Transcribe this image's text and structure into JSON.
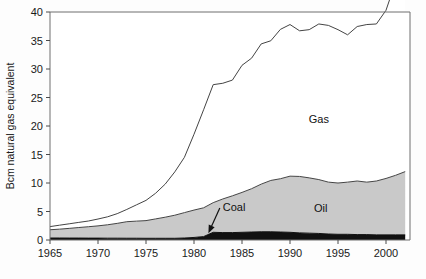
{
  "chart_data": {
    "type": "area",
    "stacked": true,
    "title": "",
    "subtitle": "",
    "xlabel": "",
    "ylabel": "Bcm natural gas equivalent",
    "xlim": [
      1965,
      2002.5
    ],
    "ylim": [
      0,
      40
    ],
    "grid": false,
    "legend_position": "inline-annotations",
    "xticks": [
      1965,
      1970,
      1975,
      1980,
      1985,
      1990,
      1995,
      2000
    ],
    "xticklabels": [
      "1965",
      "1970",
      "1975",
      "1980",
      "1985",
      "1990",
      "1995",
      "2000"
    ],
    "yticks": [
      0,
      5,
      10,
      15,
      20,
      25,
      30,
      35,
      40
    ],
    "yticklabels": [
      "0",
      "5",
      "10",
      "15",
      "20",
      "25",
      "30",
      "35",
      "40"
    ],
    "x": [
      1965,
      1966,
      1967,
      1968,
      1969,
      1970,
      1971,
      1972,
      1973,
      1974,
      1975,
      1976,
      1977,
      1978,
      1979,
      1980,
      1981,
      1982,
      1983,
      1984,
      1985,
      1986,
      1987,
      1988,
      1989,
      1990,
      1991,
      1992,
      1993,
      1994,
      1995,
      1996,
      1997,
      1998,
      1999,
      2000,
      2001,
      2002
    ],
    "series": [
      {
        "name": "Coal",
        "color": "#111111",
        "values": [
          0.35,
          0.35,
          0.34,
          0.34,
          0.33,
          0.33,
          0.32,
          0.32,
          0.31,
          0.31,
          0.3,
          0.3,
          0.3,
          0.3,
          0.35,
          0.45,
          0.6,
          1.35,
          1.3,
          1.3,
          1.35,
          1.4,
          1.45,
          1.45,
          1.4,
          1.35,
          1.25,
          1.2,
          1.15,
          1.05,
          1.0,
          1.0,
          0.95,
          0.95,
          0.9,
          0.9,
          0.9,
          0.9
        ]
      },
      {
        "name": "Oil",
        "color": "#c9c9c9",
        "values": [
          1.45,
          1.55,
          1.7,
          1.85,
          2.0,
          2.15,
          2.35,
          2.6,
          2.9,
          3.0,
          3.1,
          3.4,
          3.7,
          4.05,
          4.45,
          4.8,
          5.05,
          5.2,
          5.9,
          6.45,
          7.0,
          7.6,
          8.35,
          9.0,
          9.35,
          9.85,
          9.9,
          9.7,
          9.45,
          9.1,
          9.0,
          9.15,
          9.4,
          9.2,
          9.45,
          9.9,
          10.45,
          11.1
        ]
      },
      {
        "name": "Gas",
        "color": "#ffffff",
        "values": [
          0.55,
          0.7,
          0.8,
          0.9,
          1.0,
          1.2,
          1.4,
          1.7,
          2.15,
          2.85,
          3.55,
          4.5,
          5.8,
          7.6,
          9.7,
          13.3,
          17.2,
          20.7,
          20.3,
          20.3,
          22.3,
          22.9,
          24.6,
          24.5,
          26.2,
          26.6,
          25.55,
          26.0,
          27.3,
          27.5,
          26.9,
          25.85,
          27.1,
          27.65,
          27.55,
          29.5,
          33.9,
          38.1
        ]
      }
    ],
    "totals_note": "values are stacked: coal bottom, oil middle, gas top",
    "annotations": [
      {
        "name": "gas-label",
        "text": "Gas",
        "x": 1993.0,
        "y": 20.5
      },
      {
        "name": "oil-label",
        "text": "Oil",
        "x": 1993.2,
        "y": 5.0
      },
      {
        "name": "coal-label",
        "text": "Coal",
        "x": 1983.0,
        "y": 5.1,
        "arrow_to_x": 1981.5,
        "arrow_to_y": 1.2
      }
    ]
  },
  "axis": {
    "y_title": "Bcm natural gas equivalent"
  },
  "labels": {
    "gas": "Gas",
    "oil": "Oil",
    "coal": "Coal"
  },
  "colors": {
    "coal": "#111111",
    "oil": "#c9c9c9",
    "gas": "#ffffff",
    "line": "#444444",
    "frame": "#6e6e6e",
    "text": "#1a1a1a"
  }
}
